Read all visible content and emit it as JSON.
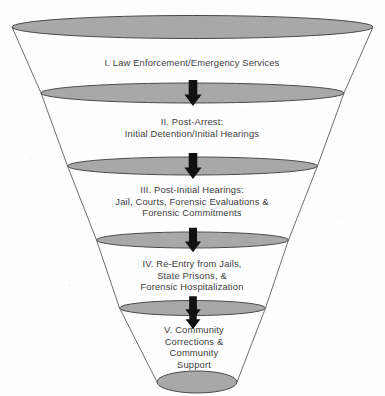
{
  "diagram": {
    "type": "funnel",
    "orientation": "inverted-cone",
    "stage_count": 5,
    "colors": {
      "ellipse_fill": "#a8a8a8",
      "ellipse_stroke": "#4a4a4a",
      "cone_line": "#6e6e6e",
      "arrow_fill": "#111111",
      "text": "#3d3d3d",
      "background": "#fefefe"
    },
    "stages": [
      {
        "numeral": "I.",
        "label": "I.  Law Enforcement/Emergency Services",
        "name": "law-enforcement-emergency-services"
      },
      {
        "numeral": "II.",
        "label": "II. Post-Arrest:\nInitial Detention/Initial Hearings",
        "name": "post-arrest-initial-detention-hearings"
      },
      {
        "numeral": "III.",
        "label": "III. Post-Initial Hearings:\nJail, Courts, Forensic Evaluations &\nForensic Commitments",
        "name": "post-initial-hearings-jail-courts"
      },
      {
        "numeral": "IV.",
        "label": "IV. Re-Entry from Jails,\nState Prisons, &\nForensic Hospitalization",
        "name": "re-entry-jails-prisons-hospitalization"
      },
      {
        "numeral": "V.",
        "label": "V.  Community\nCorrections &\nCommunity\nSupport",
        "name": "community-corrections-support"
      }
    ],
    "flow_arrows": [
      {
        "name": "arrow-stage-1-to-2",
        "direction": "down"
      },
      {
        "name": "arrow-stage-2-to-3",
        "direction": "down"
      },
      {
        "name": "arrow-stage-3-to-4",
        "direction": "down"
      },
      {
        "name": "arrow-stage-4-to-5",
        "direction": "down"
      },
      {
        "name": "arrow-stage-5-to-outlet",
        "direction": "down"
      }
    ],
    "rings": [
      {
        "name": "ring-top",
        "cx": 192.5,
        "cy": 27,
        "rx": 180.5,
        "ry": 11.5
      },
      {
        "name": "ring-1-2",
        "cx": 192.5,
        "cy": 93,
        "rx": 151.5,
        "ry": 10.0
      },
      {
        "name": "ring-2-3",
        "cx": 192.5,
        "cy": 166,
        "rx": 125.0,
        "ry": 9.0
      },
      {
        "name": "ring-3-4",
        "cx": 192.5,
        "cy": 240,
        "rx": 96.0,
        "ry": 8.0
      },
      {
        "name": "ring-4-5",
        "cx": 192.5,
        "cy": 308,
        "rx": 73.0,
        "ry": 7.5
      },
      {
        "name": "ring-bottom",
        "cx": 197.0,
        "cy": 382,
        "rx": 40.0,
        "ry": 11.0
      }
    ]
  }
}
